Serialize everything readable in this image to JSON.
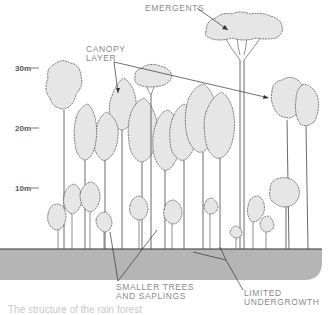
{
  "diagram": {
    "labels": {
      "emergents": "EMERGENTS",
      "canopy_line1": "CANOPY",
      "canopy_line2": "LAYER",
      "smaller_line1": "SMALLER TREES",
      "smaller_line2": "AND SAPLINGS",
      "undergrowth_line1": "LIMITED",
      "undergrowth_line2": "UNDERGROWTH"
    },
    "height_scale": [
      {
        "label": "30m",
        "value_m": 30
      },
      {
        "label": "20m",
        "value_m": 20
      },
      {
        "label": "10m",
        "value_m": 10
      }
    ],
    "caption": "The structure of the rain forest"
  }
}
